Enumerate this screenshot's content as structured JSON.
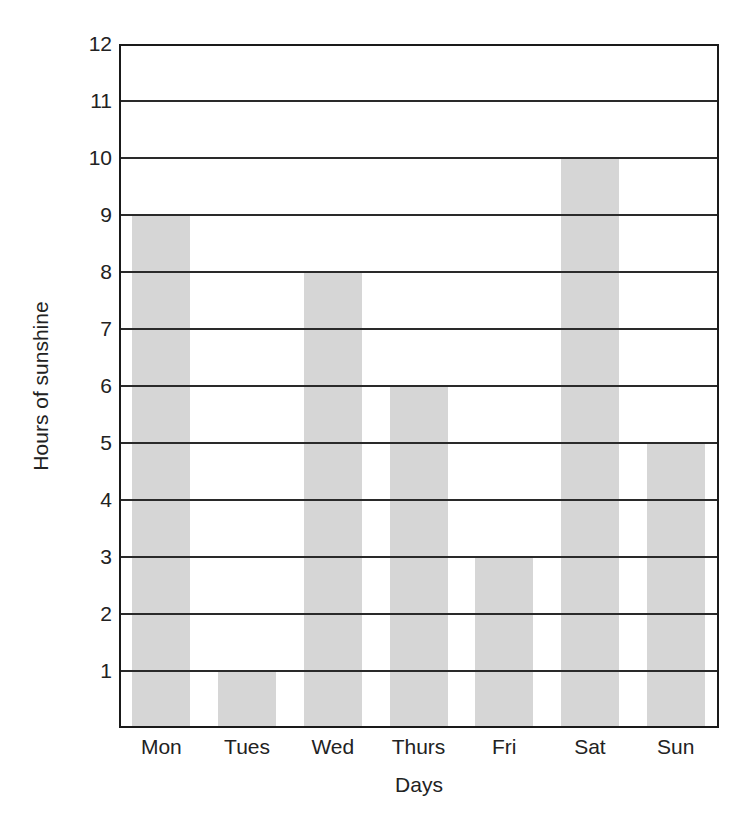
{
  "chart_data": {
    "type": "bar",
    "title": "",
    "xlabel": "Days",
    "ylabel": "Hours of sunshine",
    "categories": [
      "Mon",
      "Tues",
      "Wed",
      "Thurs",
      "Fri",
      "Sat",
      "Sun"
    ],
    "values": [
      9,
      1,
      8,
      6,
      3,
      10,
      5
    ],
    "ylim": [
      0,
      12
    ],
    "yticks": [
      1,
      2,
      3,
      4,
      5,
      6,
      7,
      8,
      9,
      10,
      11,
      12
    ],
    "grid": true,
    "legend": null,
    "bar_color": "#d6d6d6",
    "grid_color": "#2a2a2a"
  },
  "axes": {
    "x_title": "Days",
    "y_title": "Hours of sunshine"
  }
}
